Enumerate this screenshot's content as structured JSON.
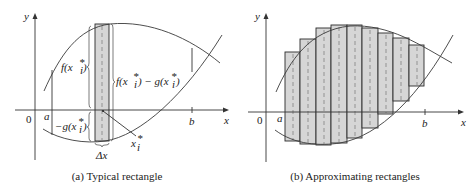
{
  "panels": [
    {
      "id": "a",
      "caption": "(a) Typical rectangle",
      "axis_labels": {
        "x": "x",
        "y": "y",
        "origin": "0"
      },
      "ticks": {
        "a": "a",
        "b": "b"
      },
      "labels": {
        "f_top": "f(x",
        "f_sub": "i",
        "f_sup": "*",
        "f_close": ")",
        "f_minus_g": "f(x",
        "f_minus_g_mid": ") − g(x",
        "neg_g": "−g(x",
        "xi": "x",
        "xi_sub": "i",
        "xi_sup": "*",
        "dx": "Δx"
      }
    },
    {
      "id": "b",
      "caption": "(b) Approximating rectangles",
      "axis_labels": {
        "x": "x",
        "y": "y",
        "origin": "0"
      },
      "ticks": {
        "a": "a",
        "b": "b"
      },
      "rectangle_count": 9
    }
  ],
  "colors": {
    "rect_fill": "#d6d6d6",
    "stroke": "#2a2a2a"
  }
}
